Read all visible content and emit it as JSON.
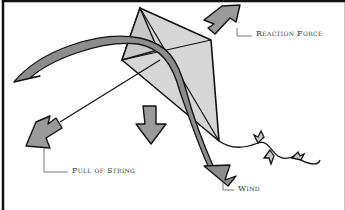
{
  "diagram": {
    "labels": {
      "reaction_force": "Reaction Force",
      "pull_of_string": "Pull of String",
      "wind": "Wind"
    },
    "colors": {
      "outline": "#111111",
      "kite_fill": "#d4d4d4",
      "arrow_fill": "#9a9a9a",
      "wind_arrow_fill": "#8a8a8a",
      "text": "#3a3a3a",
      "background": "#ffffff"
    }
  }
}
